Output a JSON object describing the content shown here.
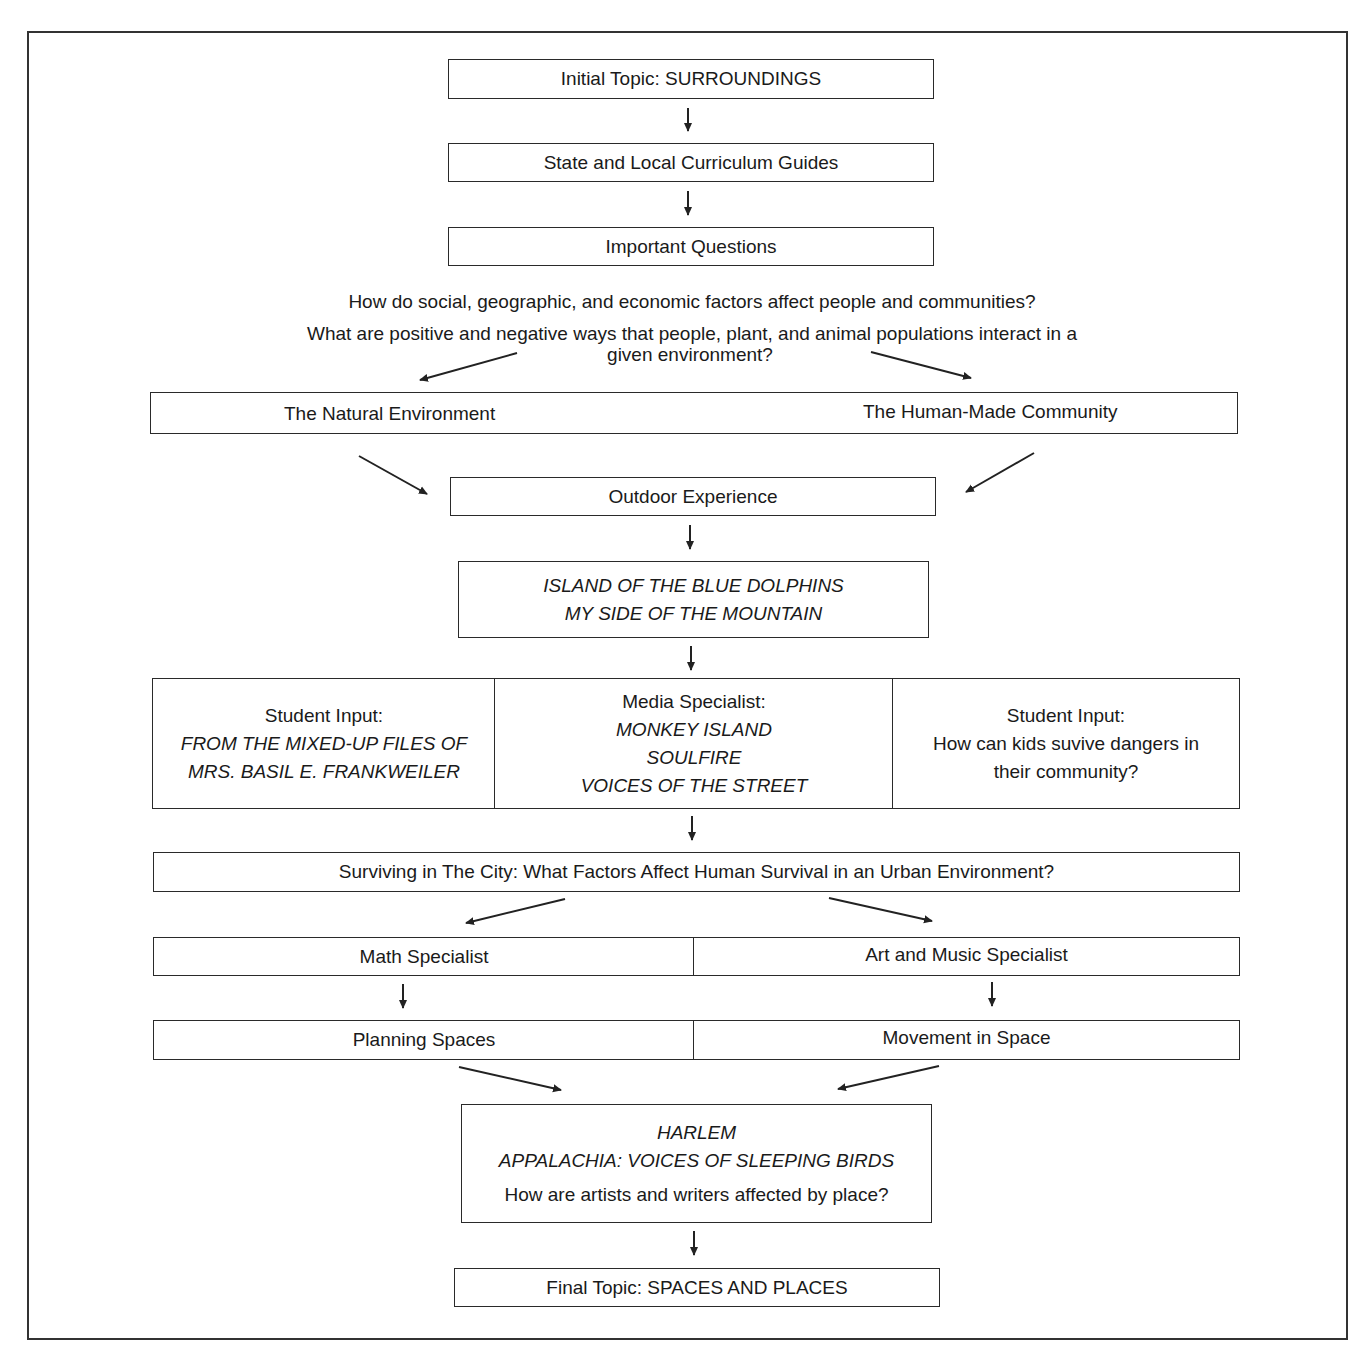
{
  "diagram": {
    "type": "flowchart",
    "nodes": {
      "initial_topic": "Initial Topic: SURROUNDINGS",
      "curriculum_guides": "State and Local Curriculum Guides",
      "important_questions": "Important Questions",
      "questions": [
        "How do social, geographic, and economic factors affect people and communities?",
        "What are positive and negative ways that people, plant, and animal populations interact in a",
        "given environment?"
      ],
      "branches": {
        "left": "The Natural Environment",
        "right": "The Human-Made Community"
      },
      "outdoor_experience": "Outdoor Experience",
      "books_1": [
        "ISLAND OF THE BLUE DOLPHINS",
        "MY SIDE OF THE MOUNTAIN"
      ],
      "inputs": {
        "left": {
          "heading": "Student Input:",
          "lines": [
            "FROM THE MIXED-UP FILES OF",
            "MRS. BASIL E. FRANKWEILER"
          ]
        },
        "middle": {
          "heading": "Media Specialist:",
          "lines": [
            "MONKEY ISLAND",
            "SOULFIRE",
            "VOICES OF THE STREET"
          ]
        },
        "right": {
          "heading": "Student Input:",
          "lines": [
            "How can kids suvive dangers in",
            "their community?"
          ]
        }
      },
      "surviving_city": "Surviving in The City: What Factors Affect Human Survival in an Urban Environment?",
      "specialists": {
        "left": "Math Specialist",
        "right": "Art and Music Specialist"
      },
      "activities": {
        "left": "Planning Spaces",
        "right": "Movement in Space"
      },
      "books_2": {
        "titles": [
          "HARLEM",
          "APPALACHIA: VOICES OF SLEEPING BIRDS"
        ],
        "question": "How are artists and writers affected by place?"
      },
      "final_topic": "Final Topic: SPACES AND PLACES"
    },
    "colors": {
      "line": "#2a2a2a",
      "text": "#1a1a1a",
      "background": "#ffffff"
    }
  }
}
